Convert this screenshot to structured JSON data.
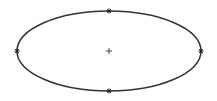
{
  "diagram": {
    "shape": "ellipse",
    "center": {
      "x": 109,
      "y": 51
    },
    "rx": 92,
    "ry": 40,
    "stroke_color": "#333333",
    "stroke_width": 1.5,
    "fill": "#ffffff",
    "center_marker": "plus",
    "vertex_marker": "asterisk",
    "vertices": [
      {
        "name": "top",
        "x": 109,
        "y": 11
      },
      {
        "name": "right",
        "x": 201,
        "y": 51
      },
      {
        "name": "bottom",
        "x": 109,
        "y": 91
      },
      {
        "name": "left",
        "x": 17,
        "y": 51
      }
    ]
  }
}
